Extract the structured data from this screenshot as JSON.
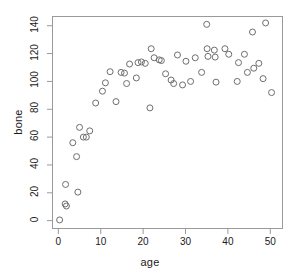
{
  "chart_data": {
    "type": "scatter",
    "title": "",
    "xlabel": "age",
    "ylabel": "bone",
    "xlim": [
      -1.5,
      53
    ],
    "ylim": [
      -6,
      147
    ],
    "xticks": [
      0,
      10,
      20,
      30,
      40,
      50
    ],
    "yticks": [
      0,
      20,
      40,
      60,
      80,
      100,
      120,
      140
    ],
    "grid": false,
    "legend": null,
    "marker": "open-circle",
    "marker_color": "#6e6e6e",
    "marker_size": 3,
    "frame_color": "#9a9a9a",
    "background": "#ffffff",
    "points": [
      {
        "x": 0.3,
        "y": 0.5
      },
      {
        "x": 1.6,
        "y": 12.0
      },
      {
        "x": 1.9,
        "y": 10.5
      },
      {
        "x": 1.7,
        "y": 26.0
      },
      {
        "x": 4.6,
        "y": 20.5
      },
      {
        "x": 3.4,
        "y": 56.0
      },
      {
        "x": 4.3,
        "y": 46.0
      },
      {
        "x": 5.0,
        "y": 67.0
      },
      {
        "x": 5.9,
        "y": 60.0
      },
      {
        "x": 6.6,
        "y": 60.0
      },
      {
        "x": 7.4,
        "y": 64.5
      },
      {
        "x": 8.8,
        "y": 84.5
      },
      {
        "x": 10.4,
        "y": 93.0
      },
      {
        "x": 11.1,
        "y": 99.0
      },
      {
        "x": 12.2,
        "y": 107.0
      },
      {
        "x": 13.6,
        "y": 85.5
      },
      {
        "x": 14.8,
        "y": 106.5
      },
      {
        "x": 15.6,
        "y": 106.0
      },
      {
        "x": 16.1,
        "y": 98.5
      },
      {
        "x": 16.8,
        "y": 112.5
      },
      {
        "x": 18.4,
        "y": 102.5
      },
      {
        "x": 18.8,
        "y": 113.5
      },
      {
        "x": 19.6,
        "y": 114.0
      },
      {
        "x": 20.5,
        "y": 113.0
      },
      {
        "x": 21.6,
        "y": 81.0
      },
      {
        "x": 21.9,
        "y": 123.5
      },
      {
        "x": 22.6,
        "y": 117.0
      },
      {
        "x": 23.8,
        "y": 115.5
      },
      {
        "x": 24.3,
        "y": 115.0
      },
      {
        "x": 25.3,
        "y": 105.5
      },
      {
        "x": 26.6,
        "y": 101.0
      },
      {
        "x": 27.2,
        "y": 98.5
      },
      {
        "x": 28.1,
        "y": 119.0
      },
      {
        "x": 29.3,
        "y": 97.5
      },
      {
        "x": 30.1,
        "y": 114.5
      },
      {
        "x": 31.2,
        "y": 100.0
      },
      {
        "x": 32.3,
        "y": 117.0
      },
      {
        "x": 33.8,
        "y": 106.5
      },
      {
        "x": 35.0,
        "y": 141.0
      },
      {
        "x": 35.1,
        "y": 123.5
      },
      {
        "x": 35.3,
        "y": 118.0
      },
      {
        "x": 36.8,
        "y": 122.5
      },
      {
        "x": 37.0,
        "y": 117.5
      },
      {
        "x": 37.2,
        "y": 99.5
      },
      {
        "x": 39.3,
        "y": 123.5
      },
      {
        "x": 40.2,
        "y": 119.5
      },
      {
        "x": 42.2,
        "y": 100.0
      },
      {
        "x": 42.5,
        "y": 113.5
      },
      {
        "x": 43.9,
        "y": 119.5
      },
      {
        "x": 44.6,
        "y": 106.5
      },
      {
        "x": 45.8,
        "y": 135.5
      },
      {
        "x": 46.1,
        "y": 109.5
      },
      {
        "x": 47.3,
        "y": 113.0
      },
      {
        "x": 48.3,
        "y": 102.0
      },
      {
        "x": 48.9,
        "y": 142.0
      },
      {
        "x": 50.3,
        "y": 92.0
      }
    ]
  }
}
